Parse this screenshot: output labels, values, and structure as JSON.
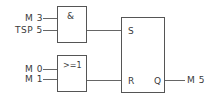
{
  "diagram": {
    "inputs": [
      {
        "id": "m3",
        "label": "M 3"
      },
      {
        "id": "tsp5",
        "label": "TSP 5"
      },
      {
        "id": "m0",
        "label": "M 0"
      },
      {
        "id": "m1",
        "label": "M 1"
      }
    ],
    "gates": {
      "and_gate": {
        "symbol": "&"
      },
      "or_gate": {
        "symbol": ">=1"
      },
      "rs_flipflop": {
        "set_pin": "S",
        "reset_pin": "R",
        "output_pin": "Q"
      }
    },
    "output": {
      "label": "M 5"
    }
  }
}
